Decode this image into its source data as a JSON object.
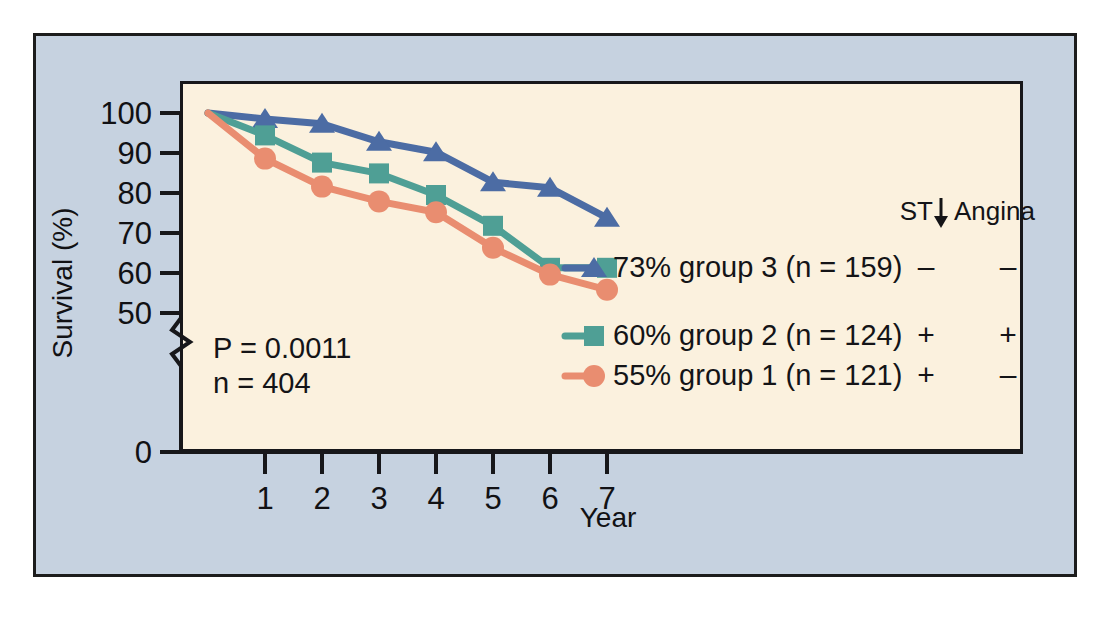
{
  "figure": {
    "background_color": "#ffffff",
    "panel_color": "#c6d2e0",
    "plot_color": "#fbf1de",
    "border_color": "#1c1c1c"
  },
  "chart_data": {
    "type": "line",
    "title": "",
    "xlabel": "Year",
    "ylabel": "Survival (%)",
    "x": [
      0,
      1,
      2,
      3,
      4,
      5,
      6,
      7
    ],
    "xlim": [
      0,
      7
    ],
    "ylim": [
      50,
      100
    ],
    "y_axis_break": true,
    "y_break_from": 0,
    "y_break_to": 50,
    "x_tick_labels": [
      "1",
      "2",
      "3",
      "4",
      "5",
      "6",
      "7"
    ],
    "y_tick_labels": [
      "100",
      "90",
      "80",
      "70",
      "60",
      "50",
      "0"
    ],
    "y_ticks": [
      100,
      90,
      80,
      70,
      60,
      50,
      0
    ],
    "grid": false,
    "legend_position": "right-inside",
    "series": [
      {
        "name": "group 3",
        "label": "73% group 3 (n = 159)",
        "color": "#4c6ca4",
        "marker": "triangle",
        "n": 159,
        "final_survival": 73,
        "st_depression": "–",
        "angina": "–",
        "values": [
          100,
          98.5,
          97.3,
          92.8,
          90.2,
          82.7,
          81.3,
          73.8
        ]
      },
      {
        "name": "group 2",
        "label": "60% group 2 (n = 124)",
        "color": "#4f9f95",
        "marker": "square",
        "n": 124,
        "final_survival": 60,
        "st_depression": "+",
        "angina": "+",
        "values": [
          100,
          94.4,
          87.6,
          84.9,
          79.5,
          71.8,
          61.3,
          61.3
        ]
      },
      {
        "name": "group 1",
        "label": "55% group 1 (n = 121)",
        "color": "#e98d70",
        "marker": "circle",
        "n": 121,
        "final_survival": 55,
        "st_depression": "+",
        "angina": "–",
        "values": [
          100,
          88.6,
          81.6,
          77.9,
          75.2,
          66.3,
          59.6,
          55.8
        ]
      }
    ],
    "annotations": {
      "p_value": "P = 0.0011",
      "sample_size": "n = 404"
    },
    "legend_header": {
      "st_label": "ST",
      "st_arrow": "↓",
      "angina_label": "Angina"
    }
  }
}
